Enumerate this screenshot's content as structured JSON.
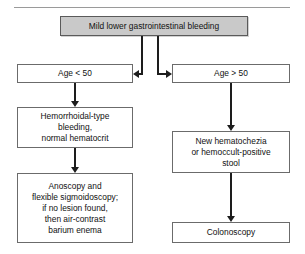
{
  "figure": {
    "background_color": "#ffffff",
    "line_color": "#1d1d1d",
    "box_border_color": "#6b6b6b",
    "shaded_fill_color": "#c9c9c9"
  },
  "nodes": {
    "root": {
      "label": "Mild lower gastrointestinal bleeding",
      "style": "shaded"
    },
    "age_under_50": {
      "label": "Age < 50",
      "style": "plain"
    },
    "age_over_50": {
      "label": "Age > 50",
      "style": "plain"
    },
    "hemorrhoidal": {
      "label": "Hemorrhoidal-type\nbleeding,\nnormal hematocrit",
      "style": "plain"
    },
    "anoscopy": {
      "label": "Anoscopy and\nflexible sigmoidoscopy;\nif no lesion found,\nthen air-contrast\nbarium enema",
      "style": "plain"
    },
    "hematochezia": {
      "label": "New hematochezia\nor hemoccult-positive\nstool",
      "style": "plain"
    },
    "colonoscopy": {
      "label": "Colonoscopy",
      "style": "plain"
    }
  },
  "connectors": [
    {
      "name": "root-to-left-branch",
      "from": "root",
      "to": "age_under_50"
    },
    {
      "name": "root-to-right-branch",
      "from": "root",
      "to": "age_over_50"
    },
    {
      "name": "left-age-to-hemorrhoidal",
      "from": "age_under_50",
      "to": "hemorrhoidal"
    },
    {
      "name": "hemorrhoidal-to-anoscopy",
      "from": "hemorrhoidal",
      "to": "anoscopy"
    },
    {
      "name": "right-age-to-hematochezia",
      "from": "age_over_50",
      "to": "hematochezia"
    },
    {
      "name": "hematochezia-to-colonoscopy",
      "from": "hematochezia",
      "to": "colonoscopy"
    }
  ]
}
